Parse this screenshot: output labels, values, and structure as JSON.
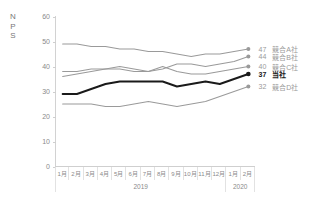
{
  "chart_data": {
    "type": "line",
    "title": "",
    "ylabel": "NPS",
    "xlabel": "",
    "ylim": [
      0,
      60
    ],
    "yticks": [
      0,
      10,
      20,
      30,
      40,
      50,
      60
    ],
    "grid": false,
    "legend_position": "right-end-labels",
    "categories": [
      "1月",
      "2月",
      "3月",
      "4月",
      "5月",
      "6月",
      "7月",
      "8月",
      "9月",
      "10月",
      "11月",
      "12月",
      "1月",
      "2月"
    ],
    "year_groups": [
      {
        "label": "2019",
        "span": 12
      },
      {
        "label": "2020",
        "span": 2
      }
    ],
    "series": [
      {
        "name": "競合A社",
        "end_value": 47,
        "color": "#9a9a9a",
        "highlight": false,
        "values": [
          49,
          49,
          48,
          48,
          47,
          47,
          46,
          46,
          45,
          44,
          45,
          45,
          46,
          47
        ]
      },
      {
        "name": "競合B社",
        "end_value": 44,
        "color": "#9a9a9a",
        "highlight": false,
        "values": [
          38,
          38,
          39,
          39,
          40,
          39,
          38,
          39,
          41,
          41,
          40,
          41,
          42,
          44
        ]
      },
      {
        "name": "競合C社",
        "end_value": 40,
        "color": "#9a9a9a",
        "highlight": false,
        "values": [
          36,
          37,
          38,
          39,
          39,
          38,
          38,
          40,
          38,
          37,
          37,
          38,
          39,
          40
        ]
      },
      {
        "name": "当社",
        "end_value": 37,
        "color": "#1a1a1a",
        "highlight": true,
        "values": [
          29,
          29,
          31,
          33,
          34,
          34,
          34,
          34,
          32,
          33,
          34,
          33,
          35,
          37
        ]
      },
      {
        "name": "競合D社",
        "end_value": 32,
        "color": "#9a9a9a",
        "highlight": false,
        "values": [
          25,
          25,
          25,
          24,
          24,
          25,
          26,
          25,
          24,
          25,
          26,
          28,
          30,
          32
        ]
      }
    ]
  },
  "axes": {
    "y_title_chars": [
      "N",
      "P",
      "S"
    ]
  }
}
